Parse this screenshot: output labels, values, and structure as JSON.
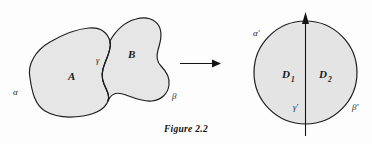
{
  "figure": {
    "caption": "Figure 2.2",
    "caption_position": "bottom-center",
    "background_color": "#fdfdfd",
    "ink_color": "#1c1c1c",
    "region_fill_color": "#e4e4e4"
  },
  "left_diagram": {
    "description": "Two adjoining irregular blob regions A and B sharing a common boundary arc",
    "regions": [
      {
        "id": "A",
        "label": "A",
        "position": "left-blob-center"
      },
      {
        "id": "B",
        "label": "B",
        "position": "right-blob-center"
      }
    ],
    "boundary_labels": [
      {
        "id": "alpha",
        "label": "α",
        "position": "outer-left"
      },
      {
        "id": "gamma",
        "label": "γ",
        "position": "shared-boundary-middle"
      },
      {
        "id": "beta",
        "label": "β",
        "position": "outer-lower-right"
      }
    ]
  },
  "map_arrow": {
    "direction": "left-to-right",
    "label": ""
  },
  "right_diagram": {
    "description": "A disk divided by a vertical diameter into two half-disks D1 and D2",
    "regions": [
      {
        "id": "D1",
        "label": "D",
        "subscript": "1",
        "position": "left-half-disk"
      },
      {
        "id": "D2",
        "label": "D",
        "subscript": "2",
        "position": "right-half-disk"
      }
    ],
    "boundary_labels": [
      {
        "id": "alpha-prime",
        "label": "α′",
        "position": "upper-left-outside"
      },
      {
        "id": "gamma-prime",
        "label": "γ′",
        "position": "lower-center-inside"
      },
      {
        "id": "beta-prime",
        "label": "β′",
        "position": "lower-right-outside"
      }
    ],
    "axis": {
      "orientation": "vertical",
      "arrow_at": "top"
    }
  }
}
